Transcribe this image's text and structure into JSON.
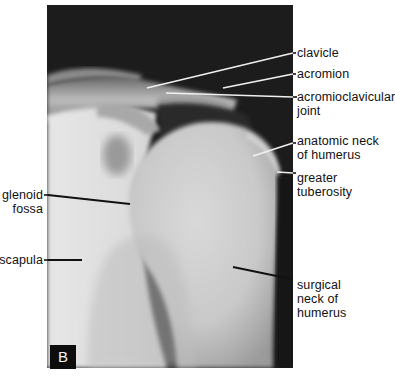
{
  "figure": {
    "panel_label": "B",
    "labels_right": [
      {
        "id": "clavicle",
        "lines": [
          "clavicle"
        ]
      },
      {
        "id": "acromion",
        "lines": [
          "acromion"
        ]
      },
      {
        "id": "acromioclavicular-joint",
        "lines": [
          "acromioclavicular",
          "joint"
        ]
      },
      {
        "id": "anatomic-neck-of-humerus",
        "lines": [
          "anatomic neck",
          "of humerus"
        ]
      },
      {
        "id": "greater-tuberosity",
        "lines": [
          "greater",
          "tuberosity"
        ]
      },
      {
        "id": "surgical-neck-of-humerus",
        "lines": [
          "surgical",
          "neck of",
          "humerus"
        ]
      }
    ],
    "labels_left": [
      {
        "id": "glenoid-fossa",
        "lines": [
          "glenoid",
          "fossa"
        ]
      },
      {
        "id": "scapula",
        "lines": [
          "scapula"
        ]
      }
    ]
  }
}
